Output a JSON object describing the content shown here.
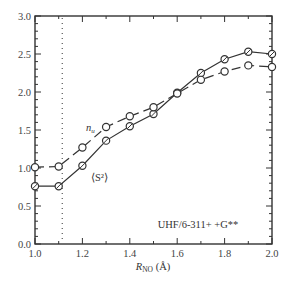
{
  "chart_data": {
    "type": "line",
    "title": "",
    "xlabel": "R_NO (Å)",
    "xlabel_main": "R",
    "xlabel_sub": "NO",
    "xlabel_unit": " (Å)",
    "ylabel": "",
    "xlim": [
      1.0,
      2.0
    ],
    "ylim": [
      0.0,
      3.0
    ],
    "x_ticks": [
      1.0,
      1.2,
      1.4,
      1.6,
      1.8,
      2.0
    ],
    "x_tick_labels": [
      "1.0",
      "1.2",
      "1.4",
      "1.6",
      "1.8",
      "2.0"
    ],
    "y_ticks": [
      0.0,
      0.5,
      1.0,
      1.5,
      2.0,
      2.5,
      3.0
    ],
    "y_tick_labels": [
      "0.0",
      "0.5",
      "1.0",
      "1.5",
      "2.0",
      "2.5",
      "3.0"
    ],
    "grid": false,
    "legend": "none (inline labels)",
    "x": [
      1.0,
      1.1,
      1.2,
      1.3,
      1.4,
      1.5,
      1.6,
      1.7,
      1.8,
      1.9,
      2.0
    ],
    "series": [
      {
        "name": "⟨S²⟩",
        "style": "solid",
        "marker": "crossed-circle",
        "values": [
          0.76,
          0.76,
          1.03,
          1.36,
          1.55,
          1.71,
          1.99,
          2.25,
          2.43,
          2.53,
          2.5
        ]
      },
      {
        "name": "n_u",
        "style": "dashed",
        "marker": "open-circle",
        "values": [
          1.01,
          1.02,
          1.27,
          1.54,
          1.68,
          1.8,
          1.98,
          2.16,
          2.27,
          2.35,
          2.33
        ]
      }
    ],
    "annotations": [
      {
        "text": "UHF/6-311+ +G**",
        "x": 1.78,
        "y": 0.22
      },
      {
        "text": "n_u",
        "x": 1.17,
        "y": 1.5
      },
      {
        "text": "⟨S²⟩",
        "x": 1.24,
        "y": 0.86
      }
    ],
    "reference_line": {
      "x": 1.115,
      "style": "dotted",
      "orientation": "vertical"
    }
  },
  "labels": {
    "method": "UHF/6-311+ +G**",
    "nu_main": "n",
    "nu_sub": "u",
    "s2_label": "⟨S²⟩"
  }
}
